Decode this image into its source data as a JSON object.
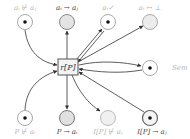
{
  "diagram": {
    "type": "petri-net",
    "transition": {
      "label": "r[P]"
    },
    "places_top": [
      {
        "id": "ai-not-aj",
        "label": "a_i ⊬ a_j",
        "display": "aᵢ ⊬ aⱼ",
        "marked": true,
        "style": "dim"
      },
      {
        "id": "ai-to-aj",
        "label": "a_i → a_j",
        "display": "aᵢ → aⱼ",
        "marked": false,
        "style": "dark"
      },
      {
        "id": "ai-check",
        "label": "a_i ✓",
        "display": "aᵢ✓",
        "marked": true,
        "style": "dim"
      },
      {
        "id": "ai-bottom",
        "label": "a_i ↦ ⊥",
        "display": "aᵢ ↦ ⊥",
        "marked": false,
        "style": "dim"
      }
    ],
    "place_right": {
      "id": "sem",
      "label": "Sem",
      "marked": true,
      "style": "dim"
    },
    "places_bottom": [
      {
        "id": "p-not-ai",
        "label": "P ⊬ a_i",
        "display": "P ⊬ aᵢ",
        "marked": true,
        "style": "dim"
      },
      {
        "id": "p-to-ai",
        "label": "P → a_i",
        "display": "P → aᵢ",
        "marked": false,
        "style": "dark"
      },
      {
        "id": "ip-not-aj",
        "label": "I[P] ⊬ a_j",
        "display": "I[P] ⊬ aⱼ",
        "marked": false,
        "style": "dim"
      },
      {
        "id": "ip-to-aj",
        "label": "I[P] → a_j",
        "display": "I[P] → aⱼ",
        "marked": true,
        "style": "dark"
      }
    ],
    "colors": {
      "arc": "#333333",
      "place_stroke": "#9a9a9a",
      "place_fill_empty": "#e6e6e6",
      "token": "#111111"
    }
  }
}
